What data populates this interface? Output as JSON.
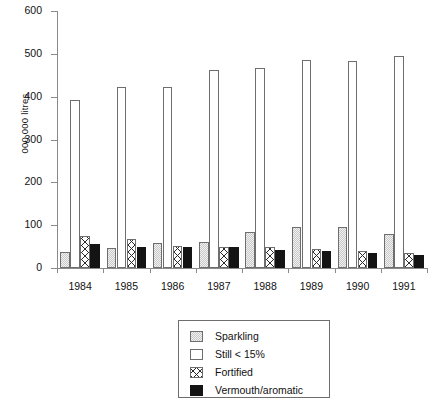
{
  "chart_data": {
    "type": "bar",
    "title": "",
    "subtitle": "",
    "xlabel": "",
    "ylabel": "000 000 litres",
    "categories": [
      "1984",
      "1985",
      "1986",
      "1987",
      "1988",
      "1989",
      "1990",
      "1991"
    ],
    "ylim": [
      0,
      600
    ],
    "yticks": [
      0,
      100,
      200,
      300,
      400,
      500,
      600
    ],
    "ytick_labels": [
      "0",
      "100",
      "200",
      "300",
      "400",
      "500",
      "600"
    ],
    "grid": false,
    "legend_position": "bottom-center",
    "series": [
      {
        "name": "Sparkling",
        "fill": "light-grey-dotted",
        "color": "#c9c9c9",
        "values": [
          38,
          47,
          58,
          60,
          85,
          95,
          95,
          80
        ]
      },
      {
        "name": "Still < 15%",
        "fill": "white",
        "color": "#ffffff",
        "values": [
          393,
          422,
          422,
          462,
          466,
          485,
          483,
          495
        ]
      },
      {
        "name": "Fortified",
        "fill": "crosshatch",
        "color": "#ffffff",
        "values": [
          75,
          68,
          52,
          50,
          50,
          45,
          40,
          35
        ]
      },
      {
        "name": "Vermouth/aromatic",
        "fill": "solid-black",
        "color": "#141414",
        "values": [
          55,
          48,
          50,
          48,
          42,
          40,
          35,
          30
        ]
      }
    ]
  },
  "legend": {
    "items": [
      {
        "label": "Sparkling",
        "swatch": "sparkling-swatch"
      },
      {
        "label": "Still < 15%",
        "swatch": "still-swatch"
      },
      {
        "label": "Fortified",
        "swatch": "fortified-swatch"
      },
      {
        "label": "Vermouth/aromatic",
        "swatch": "vermouth-swatch"
      }
    ]
  }
}
